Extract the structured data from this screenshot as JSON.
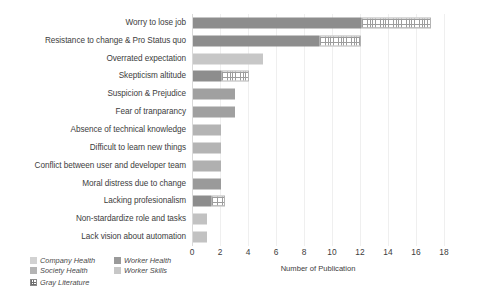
{
  "chart_data": {
    "type": "bar",
    "orientation": "horizontal",
    "stacked": true,
    "title": "",
    "xlabel": "Number of Publication",
    "ylabel": "",
    "xlim": [
      0,
      18
    ],
    "xticks": [
      0,
      2,
      4,
      6,
      8,
      10,
      12,
      14,
      16,
      18
    ],
    "grid": true,
    "legend_position": "bottom-left",
    "categories": [
      "Worry to lose job",
      "Resistance to change & Pro Status quo",
      "Overrated expectation",
      "Skepticism altitude",
      "Suspicion & Prejudice",
      "Fear of tranparancy",
      "Absence of technical knowledge",
      "Difficult to learn new things",
      "Conflict between user and developer team",
      "Moral distress due to change",
      "Lacking profesionalism",
      "Non-stardardize role and tasks",
      "Lack vision about automation"
    ],
    "series": [
      {
        "name": "Primary",
        "values": [
          12,
          9,
          5,
          2,
          3,
          3,
          2,
          2,
          2,
          2,
          1.3,
          1,
          1
        ]
      },
      {
        "name": "Gray Literature",
        "values": [
          5,
          3,
          0,
          2,
          0,
          0,
          0,
          0,
          0,
          0,
          1,
          0,
          0
        ]
      }
    ],
    "totals": [
      17,
      12,
      5,
      4,
      3,
      3,
      2,
      2,
      2,
      2,
      2.3,
      1,
      1
    ],
    "bar_colors": [
      "#8d8d8d",
      "#8d8d8d",
      "#c7c7c7",
      "#8d8d8d",
      "#a0a0a0",
      "#a0a0a0",
      "#b4b4b4",
      "#b4b4b4",
      "#b0b0b0",
      "#9a9a9a",
      "#8d8d8d",
      "#c2c2c2",
      "#c2c2c2"
    ]
  },
  "legend": {
    "items": [
      {
        "label": "Company Health",
        "color": "#d2d2d2",
        "pattern": "solid"
      },
      {
        "label": "Worker Health",
        "color": "#9a9a9a",
        "pattern": "solid"
      },
      {
        "label": "Society Health",
        "color": "#b4b4b4",
        "pattern": "solid"
      },
      {
        "label": "Worker Skills",
        "color": "#c7c7c7",
        "pattern": "solid"
      },
      {
        "label": "Gray Literature",
        "color": "#6e6e6e",
        "pattern": "hatch"
      }
    ]
  },
  "axis": {
    "x_title": "Number of Publication"
  }
}
